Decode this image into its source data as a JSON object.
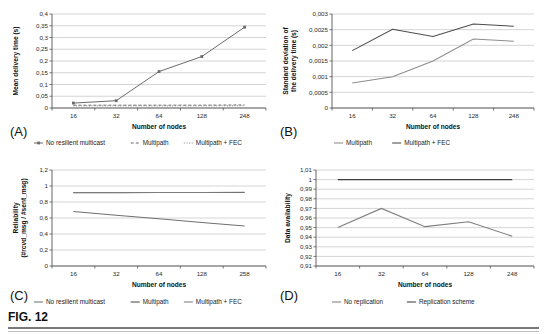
{
  "figure": {
    "caption": "FIG. 12",
    "panel_tags": {
      "a": "(A)",
      "b": "(B)",
      "c": "(C)",
      "d": "(D)"
    }
  },
  "chart_data": [
    {
      "panel": "(A)",
      "type": "line",
      "title": "",
      "xlabel": "Number of nodes",
      "ylabel": "Mean delivery time (s)",
      "categories": [
        "16",
        "32",
        "64",
        "128",
        "248"
      ],
      "ylim": [
        0,
        0.4
      ],
      "yticks": [
        "0",
        "0,05",
        "0,1",
        "0,15",
        "0,2",
        "0,25",
        "0,3",
        "0,35",
        "0,4"
      ],
      "ytick_values": [
        0,
        0.05,
        0.1,
        0.15,
        0.2,
        0.25,
        0.3,
        0.35,
        0.4
      ],
      "grid": true,
      "legend_position": "bottom",
      "series": [
        {
          "name": "No resilient multicast",
          "style": "solid-marker",
          "color": "#6b6b6b",
          "values": [
            0.021,
            0.031,
            0.155,
            0.219,
            0.344
          ]
        },
        {
          "name": "Multipath",
          "style": "dashed",
          "color": "#6b6b6b",
          "values": [
            0.012,
            0.012,
            0.012,
            0.012,
            0.013
          ]
        },
        {
          "name": "Multipath + FEC",
          "style": "dotted",
          "color": "#8a8a8a",
          "values": [
            0.009,
            0.009,
            0.009,
            0.009,
            0.01
          ]
        }
      ]
    },
    {
      "panel": "(B)",
      "type": "line",
      "title": "",
      "xlabel": "Number of nodes",
      "ylabel": "Standard deviation of the delivery time (s)",
      "categories": [
        "16",
        "32",
        "64",
        "128",
        "248"
      ],
      "ylim": [
        0,
        0.003
      ],
      "yticks": [
        "0",
        "0,0005",
        "0,001",
        "0,0015",
        "0,002",
        "0,0025",
        "0,003"
      ],
      "ytick_values": [
        0,
        0.0005,
        0.001,
        0.0015,
        0.002,
        0.0025,
        0.003
      ],
      "grid": true,
      "legend_position": "bottom",
      "series": [
        {
          "name": "Multipath",
          "style": "solid",
          "color": "#8d8d8d",
          "values": [
            0.0008,
            0.001,
            0.0015,
            0.0022,
            0.00213
          ]
        },
        {
          "name": "Multipath + FEC",
          "style": "solid",
          "color": "#4a4a4a",
          "values": [
            0.00183,
            0.00251,
            0.00228,
            0.00268,
            0.00261
          ]
        }
      ]
    },
    {
      "panel": "(C)",
      "type": "line",
      "title": "",
      "xlabel": "Number of nodes",
      "ylabel": "Reliability (#rcvd_msg / #sent_msg)",
      "categories": [
        "16",
        "32",
        "64",
        "128",
        "258"
      ],
      "ylim": [
        0,
        1.2
      ],
      "yticks": [
        "0",
        "0,2",
        "0,4",
        "0,6",
        "0,8",
        "1",
        "1,2"
      ],
      "ytick_values": [
        0,
        0.2,
        0.4,
        0.6,
        0.8,
        1,
        1.2
      ],
      "grid": true,
      "legend_position": "bottom",
      "series": [
        {
          "name": "No resilient multicast",
          "style": "solid",
          "color": "#6f6f6f",
          "values": [
            0.68,
            0.635,
            0.59,
            0.545,
            0.5
          ]
        },
        {
          "name": "Multipath",
          "style": "solid",
          "color": "#4a4a4a",
          "values": [
            0.917,
            0.917,
            0.918,
            0.919,
            0.92
          ]
        },
        {
          "name": "Multipath + FEC",
          "style": "solid",
          "color": "#7d7d7d",
          "values": [
            0.918,
            0.918,
            0.919,
            0.92,
            0.921
          ]
        }
      ]
    },
    {
      "panel": "(D)",
      "type": "line",
      "title": "",
      "xlabel": "Number of nodes",
      "ylabel": "Data availability",
      "categories": [
        "16",
        "32",
        "64",
        "128",
        "248"
      ],
      "ylim": [
        0.91,
        1.01
      ],
      "yticks": [
        "0,91",
        "0,92",
        "0,93",
        "0,94",
        "0,95",
        "0,96",
        "0,97",
        "0,98",
        "0,99",
        "1",
        "1,01"
      ],
      "ytick_values": [
        0.91,
        0.92,
        0.93,
        0.94,
        0.95,
        0.96,
        0.97,
        0.98,
        0.99,
        1,
        1.01
      ],
      "grid": true,
      "legend_position": "bottom",
      "series": [
        {
          "name": "No replication",
          "style": "solid",
          "color": "#7d7d7d",
          "values": [
            0.95,
            0.97,
            0.951,
            0.956,
            0.941
          ]
        },
        {
          "name": "Replication scheme",
          "style": "solid",
          "color": "#3d3d3d",
          "values": [
            1,
            1,
            1,
            1,
            1
          ]
        }
      ]
    }
  ]
}
